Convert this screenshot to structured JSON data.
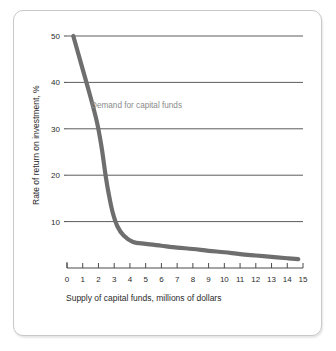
{
  "figure": {
    "card_background": "#ffffff",
    "border_color": "#c9c9c9"
  },
  "chart_data": {
    "type": "line",
    "title": "",
    "xlabel": "Supply of capital funds, millions of dollars",
    "ylabel": "Rate of return on investment, %",
    "xlim": [
      0,
      15
    ],
    "ylim": [
      0,
      50
    ],
    "xticks": [
      "0",
      "1",
      "2",
      "3",
      "4",
      "5",
      "6",
      "7",
      "8",
      "9",
      "10",
      "11",
      "12",
      "13",
      "14",
      "15"
    ],
    "yticks": [
      "10",
      "20",
      "30",
      "40",
      "50"
    ],
    "grid": "horizontal",
    "legend_position": "inline-annotation",
    "curve_color": "#6e6e6e",
    "gridline_color": "#4a4a4a",
    "series": [
      {
        "name": "Demand for capital funds",
        "annotation": "Demand for capital funds",
        "annotation_color": "#8a8a8a",
        "points": [
          {
            "x": 0.4,
            "y": 50.0
          },
          {
            "x": 0.9,
            "y": 44.0
          },
          {
            "x": 1.4,
            "y": 38.0
          },
          {
            "x": 1.9,
            "y": 31.5
          },
          {
            "x": 2.2,
            "y": 26.0
          },
          {
            "x": 2.45,
            "y": 20.0
          },
          {
            "x": 2.65,
            "y": 16.0
          },
          {
            "x": 2.9,
            "y": 12.0
          },
          {
            "x": 3.2,
            "y": 9.0
          },
          {
            "x": 3.6,
            "y": 7.0
          },
          {
            "x": 4.2,
            "y": 5.6
          },
          {
            "x": 5.0,
            "y": 5.2
          },
          {
            "x": 6.0,
            "y": 4.8
          },
          {
            "x": 7.0,
            "y": 4.4
          },
          {
            "x": 8.0,
            "y": 4.1
          },
          {
            "x": 9.0,
            "y": 3.7
          },
          {
            "x": 10.0,
            "y": 3.4
          },
          {
            "x": 11.0,
            "y": 3.0
          },
          {
            "x": 12.0,
            "y": 2.7
          },
          {
            "x": 13.0,
            "y": 2.4
          },
          {
            "x": 14.0,
            "y": 2.1
          },
          {
            "x": 14.7,
            "y": 1.9
          }
        ]
      }
    ]
  }
}
